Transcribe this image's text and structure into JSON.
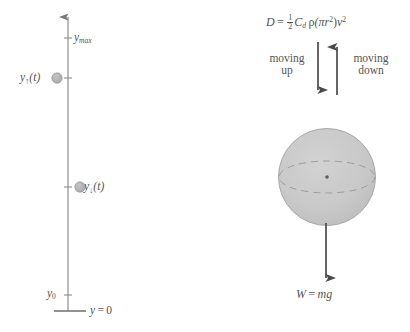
{
  "figure": {
    "background_color": "#ffffff",
    "ink_color": "#555555",
    "sphere_fill": "#c9c9c9",
    "marker_fill": "#b5b5b5"
  },
  "left_panel": {
    "name": "vertical-position-axis",
    "axis_label_top": "y",
    "axis_label_top_sub": "max",
    "marker_up": {
      "symbol": "y",
      "subscript": "↑",
      "argument": "(t)",
      "full": "y↑(t)"
    },
    "marker_down": {
      "symbol": "y",
      "subscript": "↓",
      "argument": "(t)",
      "full": "y↓(t)"
    },
    "initial_height": {
      "symbol": "y",
      "subscript": "0",
      "full": "y0"
    },
    "ground": {
      "symbol": "y",
      "equals": "=",
      "value": "0",
      "full": "y = 0"
    }
  },
  "right_panel": {
    "name": "free-body-diagram",
    "drag_equation": {
      "lhs": "D",
      "equals": "=",
      "half_num": "1",
      "half_den": "2",
      "coefficient": "C",
      "coefficient_sub": "d",
      "density": "ρ",
      "area": "(πr",
      "area_exp": "2",
      "area_close": ")",
      "velocity": "v",
      "velocity_exp": "2",
      "full": "D = ½ C_d ρ(πr²) v²"
    },
    "moving_up_label": "moving\nup",
    "moving_up_line1": "moving",
    "moving_up_line2": "up",
    "moving_down_line1": "moving",
    "moving_down_line2": "down",
    "weight_equation": {
      "lhs": "W",
      "equals": "=",
      "rhs": "mg",
      "full": "W = mg"
    }
  }
}
